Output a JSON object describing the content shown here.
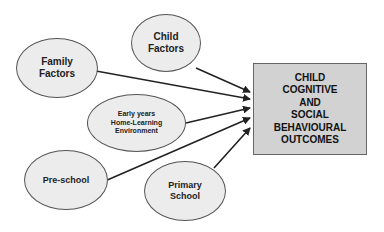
{
  "diagram": {
    "nodes": [
      {
        "id": "child-factors",
        "label": "Child\nFactors"
      },
      {
        "id": "family-factors",
        "label": "Family\nFactors"
      },
      {
        "id": "early-years-hle",
        "label": "Early years\nHome-Learning\nEnvironment"
      },
      {
        "id": "pre-school",
        "label": "Pre-school"
      },
      {
        "id": "primary-school",
        "label": "Primary\nSchool"
      }
    ],
    "outcome": {
      "label": "CHILD\nCOGNITIVE\nAND\nSOCIAL\nBEHAVIOURAL\nOUTCOMES"
    },
    "edges": [
      {
        "from": "child-factors",
        "to": "outcome"
      },
      {
        "from": "family-factors",
        "to": "outcome"
      },
      {
        "from": "early-years-hle",
        "to": "outcome"
      },
      {
        "from": "pre-school",
        "to": "outcome"
      },
      {
        "from": "primary-school",
        "to": "outcome"
      }
    ],
    "colors": {
      "node_fill": "#ececec",
      "outcome_fill": "#d2d2d2",
      "stroke": "#222222"
    }
  }
}
